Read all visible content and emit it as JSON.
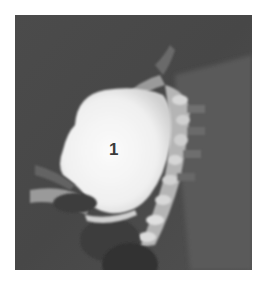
{
  "image": {
    "type": "MRI scan (sagittal, grayscale)",
    "annotation_label": "1",
    "colors": {
      "background": "#ffffff",
      "scan_field": "#4a4a4a",
      "mass_bright": "#f5f5f5",
      "label_text": "#3a3a3a"
    }
  }
}
